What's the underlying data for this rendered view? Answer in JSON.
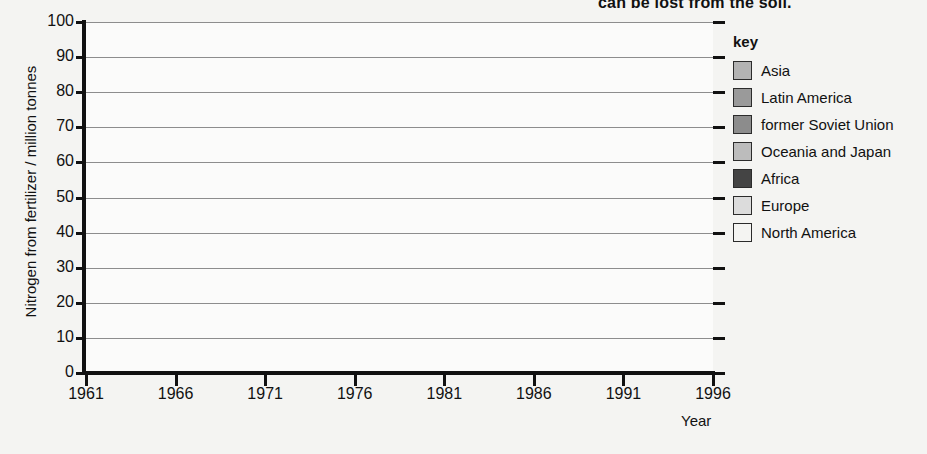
{
  "title_fragment": "can be lost from the soil,",
  "axes": {
    "y_title": "Nitrogen from fertilizer / million tonnes",
    "x_title": "Year",
    "y_ticks": [
      "0",
      "10",
      "20",
      "30",
      "40",
      "50",
      "60",
      "70",
      "80",
      "90",
      "100"
    ],
    "x_ticks": [
      "1961",
      "1966",
      "1971",
      "1976",
      "1981",
      "1986",
      "1991",
      "1996"
    ]
  },
  "legend": {
    "title": "key",
    "items": [
      {
        "label": "Asia",
        "color": "#b3b3b3"
      },
      {
        "label": "Latin America",
        "color": "#9a9a9a"
      },
      {
        "label": "former Soviet Union",
        "color": "#8c8c8c"
      },
      {
        "label": "Oceania and Japan",
        "color": "#bcbcbc"
      },
      {
        "label": "Africa",
        "color": "#444444"
      },
      {
        "label": "Europe",
        "color": "#dcdcdc"
      },
      {
        "label": "North America",
        "color": "#f4f4f2"
      }
    ]
  },
  "chart_data": {
    "type": "area",
    "stacked": true,
    "title": "can be lost from the soil,",
    "xlabel": "Year",
    "ylabel": "Nitrogen from fertilizer / million tonnes",
    "xlim": [
      1961,
      1996
    ],
    "ylim": [
      0,
      100
    ],
    "grid": true,
    "legend_position": "right",
    "x": [
      1961,
      1966,
      1971,
      1976,
      1981,
      1986,
      1991,
      1996
    ],
    "series": [
      {
        "name": "North America",
        "color": "#f4f4f2",
        "values": [
          3.5,
          5.0,
          7.5,
          10.0,
          11.5,
          12.0,
          13.0,
          14.0
        ]
      },
      {
        "name": "Europe",
        "color": "#dcdcdc",
        "values": [
          4.8,
          7.0,
          10.5,
          14.0,
          16.5,
          22.0,
          13.5,
          13.0
        ]
      },
      {
        "name": "Africa",
        "color": "#444444",
        "values": [
          0.4,
          0.6,
          0.8,
          1.0,
          1.2,
          1.5,
          1.5,
          1.5
        ]
      },
      {
        "name": "Oceania and Japan",
        "color": "#bcbcbc",
        "values": [
          1.0,
          1.4,
          2.0,
          2.6,
          3.2,
          4.0,
          4.0,
          4.0
        ]
      },
      {
        "name": "former Soviet Union",
        "color": "#8c8c8c",
        "values": [
          1.5,
          2.5,
          3.6,
          4.6,
          5.8,
          8.5,
          5.5,
          3.5
        ]
      },
      {
        "name": "Latin America",
        "color": "#9a9a9a",
        "values": [
          0.8,
          1.2,
          1.7,
          2.2,
          2.8,
          3.5,
          4.0,
          3.0
        ]
      },
      {
        "name": "Asia",
        "color": "#b3b3b3",
        "values": [
          2.0,
          4.3,
          8.9,
          16.6,
          23.0,
          36.5,
          38.5,
          44.0
        ]
      }
    ],
    "totals": [
      14.0,
      22.0,
      35.0,
      51.0,
      64.0,
      88.0,
      80.0,
      83.0
    ]
  }
}
